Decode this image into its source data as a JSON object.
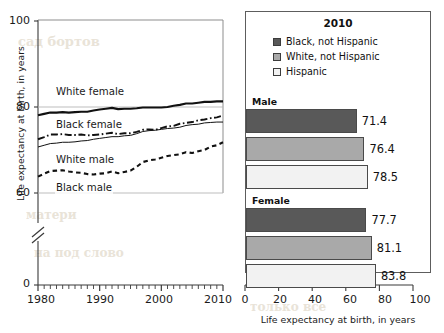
{
  "bleed": {
    "items": [
      {
        "text": "сад бортов",
        "x": 18,
        "y": 34,
        "size": 13,
        "rot": 0
      },
      {
        "text": "РЕ С А Г",
        "x": 300,
        "y": 96,
        "size": 14,
        "rot": 0
      },
      {
        "text": "А С О У Н Т С  О Ф",
        "x": 250,
        "y": 152,
        "size": 13,
        "rot": 0
      },
      {
        "text": "матери",
        "x": 26,
        "y": 208,
        "size": 12,
        "rot": 0
      },
      {
        "text": "на под слово",
        "x": 34,
        "y": 246,
        "size": 12,
        "rot": 0
      },
      {
        "text": "только все",
        "x": 250,
        "y": 300,
        "size": 12,
        "rot": 0
      }
    ]
  },
  "line_chart": {
    "ylabel": "Life expectancy at birth, in years",
    "yticks": [
      "100",
      "80",
      "60",
      "0"
    ],
    "xticks": [
      "1980",
      "1990",
      "2000",
      "2010"
    ],
    "axis_break": "//",
    "series_labels": [
      {
        "label": "White female"
      },
      {
        "label": "Black female"
      },
      {
        "label": "White male"
      },
      {
        "label": "Black male"
      }
    ]
  },
  "bar_chart": {
    "title": "2010",
    "legend": [
      {
        "label": "Black, not Hispanic",
        "color": "#595959"
      },
      {
        "label": "White, not Hispanic",
        "color": "#a9a9a9"
      },
      {
        "label": "Hispanic",
        "color": "#f2f2f2"
      }
    ],
    "groups": [
      {
        "name": "Male",
        "values": [
          "71.4",
          "76.4",
          "78.5"
        ]
      },
      {
        "name": "Female",
        "values": [
          "77.7",
          "81.1",
          "83.8"
        ]
      }
    ],
    "xticks": [
      "0",
      "20",
      "40",
      "60",
      "80",
      "100"
    ],
    "xtitle": "Life expectancy at birth, in years"
  },
  "chart_data": [
    {
      "type": "line",
      "title": "",
      "xlabel": "",
      "ylabel": "Life expectancy at birth, in years",
      "xlim": [
        1980,
        2010
      ],
      "ylim": [
        55,
        100
      ],
      "yticks": [
        0,
        60,
        80,
        100
      ],
      "y_axis_break": true,
      "y_break_between": [
        0,
        57
      ],
      "xticks": [
        1980,
        1990,
        2000,
        2010
      ],
      "x_minor_tick_step": 1,
      "grid": false,
      "legend": "inline-labels",
      "x": [
        1980,
        1981,
        1982,
        1983,
        1984,
        1985,
        1986,
        1987,
        1988,
        1989,
        1990,
        1991,
        1992,
        1993,
        1994,
        1995,
        1996,
        1997,
        1998,
        1999,
        2000,
        2001,
        2002,
        2003,
        2004,
        2005,
        2006,
        2007,
        2008,
        2009,
        2010
      ],
      "series": [
        {
          "name": "White female",
          "style": "solid-thick",
          "values": [
            78.1,
            78.4,
            78.7,
            78.7,
            78.8,
            78.7,
            78.8,
            78.9,
            78.9,
            79.2,
            79.4,
            79.6,
            79.8,
            79.5,
            79.6,
            79.6,
            79.7,
            79.9,
            79.9,
            79.9,
            79.9,
            80.0,
            80.3,
            80.5,
            80.8,
            80.8,
            81.0,
            81.2,
            81.2,
            81.3,
            81.3
          ],
          "endpoints": {
            "1980": 78.1,
            "2010": 81.3
          }
        },
        {
          "name": "Black female",
          "style": "dash-dot",
          "values": [
            72.5,
            73.0,
            73.6,
            73.6,
            73.7,
            73.5,
            73.5,
            73.6,
            73.4,
            73.5,
            73.6,
            73.8,
            74.0,
            73.7,
            73.9,
            73.9,
            74.2,
            74.7,
            74.8,
            74.7,
            75.1,
            75.5,
            75.6,
            76.1,
            76.3,
            76.5,
            76.9,
            77.1,
            77.4,
            77.6,
            78.0
          ],
          "endpoints": {
            "1980": 72.5,
            "2010": 78.0
          }
        },
        {
          "name": "White male",
          "style": "solid-thin",
          "values": [
            70.7,
            71.1,
            71.5,
            71.6,
            71.8,
            71.8,
            71.9,
            72.1,
            72.2,
            72.5,
            72.7,
            72.9,
            73.1,
            73.1,
            73.3,
            73.4,
            73.8,
            74.3,
            74.5,
            74.6,
            74.8,
            75.0,
            75.1,
            75.3,
            75.7,
            75.9,
            76.0,
            76.3,
            76.4,
            76.5,
            76.5
          ],
          "endpoints": {
            "1980": 70.7,
            "2010": 76.5
          }
        },
        {
          "name": "Black male",
          "style": "dashed",
          "values": [
            63.8,
            64.5,
            65.1,
            65.2,
            65.3,
            65.0,
            64.8,
            64.7,
            64.4,
            64.3,
            64.5,
            64.6,
            65.0,
            64.6,
            64.9,
            65.2,
            66.1,
            67.2,
            67.6,
            67.8,
            68.2,
            68.6,
            68.8,
            69.0,
            69.5,
            69.3,
            69.7,
            70.0,
            70.8,
            71.1,
            71.8
          ],
          "endpoints": {
            "1980": 63.8,
            "2010": 71.8
          }
        }
      ]
    },
    {
      "type": "bar",
      "orientation": "horizontal",
      "title": "2010",
      "xlabel": "Life expectancy at birth, in years",
      "ylabel": "",
      "xlim": [
        0,
        100
      ],
      "xticks": [
        0,
        20,
        40,
        60,
        80,
        100
      ],
      "grid": false,
      "categories": [
        "Male",
        "Female"
      ],
      "series": [
        {
          "name": "Black, not Hispanic",
          "color": "#595959",
          "values": [
            71.4,
            77.7
          ]
        },
        {
          "name": "White, not Hispanic",
          "color": "#a9a9a9",
          "values": [
            76.4,
            81.1
          ]
        },
        {
          "name": "Hispanic",
          "color": "#f2f2f2",
          "values": [
            78.5,
            83.8
          ]
        }
      ]
    }
  ]
}
